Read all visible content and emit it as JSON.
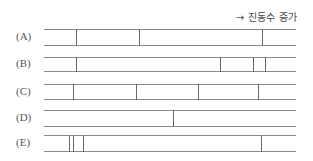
{
  "caption": "→ 진동수 증가",
  "rows": [
    {
      "label": "(A)",
      "top": 29,
      "bottom": 45,
      "ticks": [
        76,
        139,
        262
      ]
    },
    {
      "label": "(B)",
      "top": 57,
      "bottom": 71,
      "ticks": [
        76,
        220,
        253,
        265
      ]
    },
    {
      "label": "(C)",
      "top": 84,
      "bottom": 99,
      "ticks": [
        73,
        136,
        198,
        258
      ]
    },
    {
      "label": "(D)",
      "top": 110,
      "bottom": 126,
      "ticks": [
        173
      ]
    },
    {
      "label": "(E)",
      "top": 135,
      "bottom": 151,
      "ticks": [
        69,
        73,
        83,
        261
      ]
    }
  ]
}
